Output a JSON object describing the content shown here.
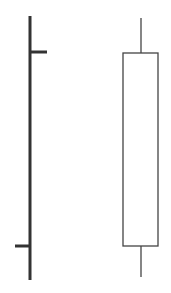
{
  "diagram": {
    "elements": [
      {
        "kind": "ohlc-bar",
        "color": "#333333",
        "stroke_width": 3,
        "x": 30,
        "high_y": 16,
        "low_y": 280,
        "open_tick": {
          "side": "left",
          "y": 246,
          "x1": 15,
          "x2": 30
        },
        "close_tick": {
          "side": "right",
          "y": 52,
          "x1": 30,
          "x2": 47
        }
      },
      {
        "kind": "candlestick",
        "color": "#444444",
        "fill": "#ffffff",
        "stroke_width": 1.3,
        "wick_x": 141,
        "high_y": 18,
        "low_y": 277,
        "body": {
          "x": 123,
          "y": 53,
          "width": 35,
          "height": 193
        }
      }
    ]
  }
}
